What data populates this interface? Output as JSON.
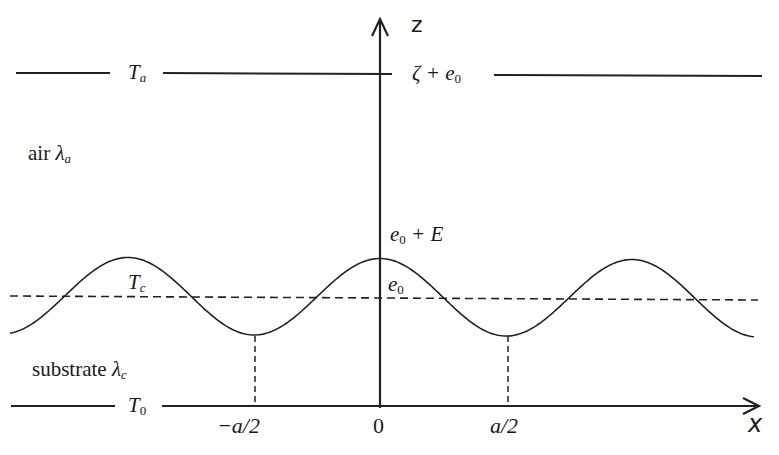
{
  "diagram": {
    "axes": {
      "z_label": "z",
      "x_label": "x"
    },
    "regions": {
      "air": {
        "text": "air",
        "symbol": "λ",
        "sub": "a"
      },
      "substrate": {
        "text": "substrate",
        "symbol": "λ",
        "sub": "c"
      }
    },
    "temperatures": {
      "top": {
        "symbol": "T",
        "sub": "a"
      },
      "interface": {
        "symbol": "T",
        "sub": "c"
      },
      "bottom": {
        "symbol": "T",
        "sub": "0"
      }
    },
    "z_levels": {
      "top": {
        "prefix": "ζ + e",
        "sub": "0"
      },
      "peak": {
        "prefix": "e",
        "sub": "0",
        "suffix": " + E"
      },
      "mean": {
        "prefix": "e",
        "sub": "0"
      }
    },
    "x_ticks": [
      "−a/2",
      "0",
      "a/2"
    ],
    "colors": {
      "stroke": "#222222",
      "background": "#ffffff"
    }
  }
}
